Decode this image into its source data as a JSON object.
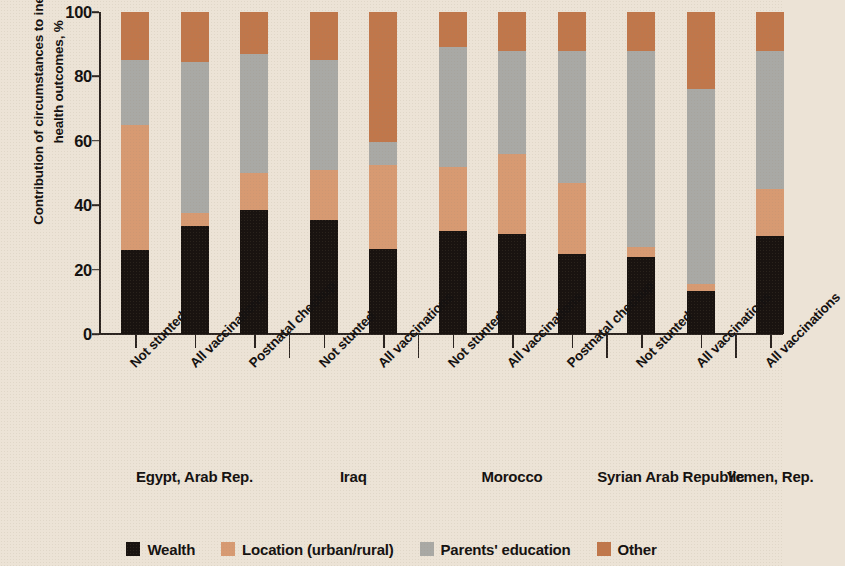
{
  "chart_data": {
    "type": "bar",
    "stacked": true,
    "title": "",
    "xlabel": "",
    "ylabel": "Contribution of circumstances to inequality in health outcomes, %",
    "ylim": [
      0,
      100
    ],
    "yticks": [
      0,
      20,
      40,
      60,
      80,
      100
    ],
    "ytick_labels": [
      "0",
      "20",
      "40",
      "60",
      "80",
      "100"
    ],
    "grid": false,
    "legend_position": "bottom",
    "categories": [
      "Not stunted",
      "All vaccinations",
      "Postnatal checkup",
      "Not stunted",
      "All vaccinations",
      "Not stunted",
      "All vaccinations",
      "Postnatal checkup",
      "Not stunted",
      "All vaccinations",
      "All vaccinations"
    ],
    "groups": [
      {
        "label": "Egypt, Arab Rep.",
        "start": 0,
        "count": 3
      },
      {
        "label": "Iraq",
        "start": 3,
        "count": 2
      },
      {
        "label": "Morocco",
        "start": 5,
        "count": 3
      },
      {
        "label": "Syrian Arab Republic",
        "start": 8,
        "count": 2
      },
      {
        "label": "Yemen, Rep.",
        "start": 10,
        "count": 1
      }
    ],
    "series": [
      {
        "name": "Wealth",
        "color": "#191310",
        "values": [
          26.0,
          33.5,
          38.5,
          35.5,
          26.5,
          32.0,
          31.0,
          25.0,
          24.0,
          13.5,
          30.5
        ]
      },
      {
        "name": "Location (urban/rural)",
        "color": "#d79a72",
        "values": [
          39.0,
          4.0,
          11.5,
          15.5,
          26.0,
          20.0,
          25.0,
          22.0,
          3.0,
          2.0,
          14.5
        ]
      },
      {
        "name": "Parents' education",
        "color": "#a9a9a5",
        "values": [
          20.0,
          47.0,
          37.0,
          34.0,
          7.0,
          37.0,
          32.0,
          41.0,
          61.0,
          60.5,
          43.0
        ]
      },
      {
        "name": "Other",
        "color": "#c0774b",
        "values": [
          15.0,
          15.5,
          13.0,
          15.0,
          40.5,
          11.0,
          12.0,
          12.0,
          12.0,
          24.0,
          12.0
        ]
      }
    ]
  },
  "legend": {
    "items": [
      {
        "label": "Wealth",
        "color": "#191310"
      },
      {
        "label": "Location (urban/rural)",
        "color": "#d79a72"
      },
      {
        "label": "Parents' education",
        "color": "#a9a9a5"
      },
      {
        "label": "Other",
        "color": "#c0774b"
      }
    ]
  },
  "figure": {
    "background": "#ece3d6",
    "axis_color": "#2b2420"
  }
}
